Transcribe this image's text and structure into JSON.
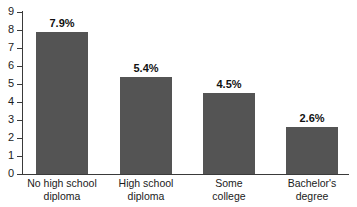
{
  "chart_data": {
    "type": "bar",
    "title": "",
    "subtitle": "",
    "xlabel": "",
    "ylabel": "",
    "categories": [
      "No high school diploma",
      "High school diploma",
      "Some college",
      "Bachelor's degree"
    ],
    "category_lines": [
      [
        "No high school",
        "diploma"
      ],
      [
        "High school",
        "diploma"
      ],
      [
        "Some",
        "college"
      ],
      [
        "Bachelor's",
        "degree"
      ]
    ],
    "values": [
      7.9,
      5.4,
      4.5,
      2.6
    ],
    "data_labels": [
      "7.9%",
      "5.4%",
      "4.5%",
      "2.6%"
    ],
    "ylim": [
      0,
      9
    ],
    "ytick_values": [
      0,
      1,
      2,
      3,
      4,
      5,
      6,
      7,
      8,
      9
    ],
    "ytick_labels": [
      "0",
      "1",
      "2",
      "3",
      "4",
      "5",
      "6",
      "7",
      "8",
      "9"
    ],
    "grid": false,
    "legend": false,
    "legend_position": "none",
    "bar_color": "#545454",
    "axis_color": "#3a3a3a",
    "text_color": "#1b1b1b",
    "background_color": "#ffffff"
  }
}
